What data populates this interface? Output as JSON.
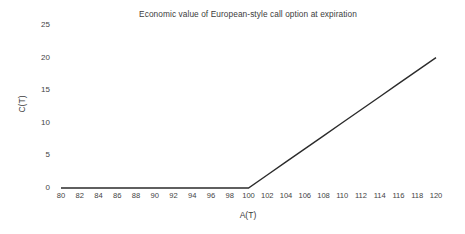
{
  "chart_data": {
    "type": "line",
    "title": "Economic value of European-style call option at expiration",
    "xlabel": "A(T)",
    "ylabel": "C(T)",
    "xlim": [
      80,
      120
    ],
    "ylim": [
      0,
      25
    ],
    "xticks": [
      80,
      82,
      84,
      86,
      88,
      90,
      92,
      94,
      96,
      98,
      100,
      102,
      104,
      106,
      108,
      110,
      112,
      114,
      116,
      118,
      120
    ],
    "yticks": [
      0,
      5,
      10,
      15,
      20,
      25
    ],
    "xtick_labels": [
      "80",
      "82",
      "84",
      "86",
      "88",
      "90",
      "92",
      "94",
      "96",
      "98",
      "100",
      "102",
      "104",
      "106",
      "108",
      "110",
      "112",
      "114",
      "116",
      "118",
      "120"
    ],
    "ytick_labels": [
      "0",
      "5",
      "10",
      "15",
      "20",
      "25"
    ],
    "grid": false,
    "legend": null,
    "strike": 100,
    "series": [
      {
        "name": "C(T) = max(A(T) - 100, 0)",
        "color": "#2b2b2b",
        "linewidth": 1.4,
        "x": [
          80,
          82,
          84,
          86,
          88,
          90,
          92,
          94,
          96,
          98,
          100,
          102,
          104,
          106,
          108,
          110,
          112,
          114,
          116,
          118,
          120
        ],
        "values": [
          0,
          0,
          0,
          0,
          0,
          0,
          0,
          0,
          0,
          0,
          0,
          2,
          4,
          6,
          8,
          10,
          12,
          14,
          16,
          18,
          20
        ]
      }
    ]
  },
  "colors": {
    "background": "#ffffff",
    "line": "#2b2b2b",
    "tick_text": "#444444",
    "title_text": "#3c3c3c"
  }
}
